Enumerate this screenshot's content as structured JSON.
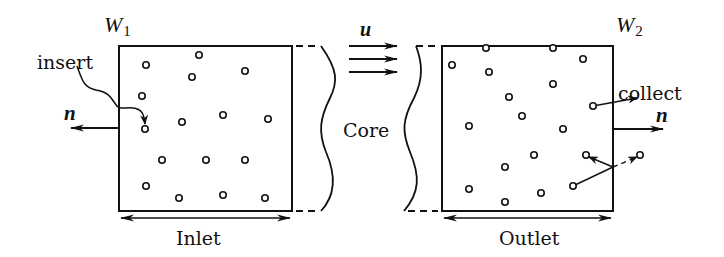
{
  "diagram": {
    "type": "domain-schematic",
    "labels": {
      "w1_main": "W",
      "w1_sub": "1",
      "w2_main": "W",
      "w2_sub": "2",
      "insert": "insert",
      "collect": "collect",
      "normal_left": "n",
      "normal_right": "n",
      "velocity": "u",
      "core": "Core",
      "inlet": "Inlet",
      "outlet": "Outlet"
    },
    "inlet_box": {
      "x": 119,
      "y": 46,
      "w": 173,
      "h": 165
    },
    "outlet_box": {
      "x": 442,
      "y": 46,
      "w": 171,
      "h": 165
    },
    "inlet_particles": [
      [
        146,
        65
      ],
      [
        199,
        55
      ],
      [
        192,
        77
      ],
      [
        245,
        71
      ],
      [
        142,
        96
      ],
      [
        145,
        129
      ],
      [
        182,
        122
      ],
      [
        223,
        115
      ],
      [
        268,
        119
      ],
      [
        162,
        160
      ],
      [
        206,
        160
      ],
      [
        245,
        160
      ],
      [
        146,
        186
      ],
      [
        179,
        198
      ],
      [
        223,
        195
      ],
      [
        265,
        198
      ]
    ],
    "outlet_particles": [
      [
        452,
        65
      ],
      [
        486,
        48
      ],
      [
        553,
        48
      ],
      [
        583,
        59
      ],
      [
        489,
        72
      ],
      [
        553,
        84
      ],
      [
        509,
        97
      ],
      [
        522,
        116
      ],
      [
        469,
        126
      ],
      [
        593,
        106
      ],
      [
        563,
        129
      ],
      [
        534,
        155
      ],
      [
        586,
        155
      ],
      [
        505,
        167
      ],
      [
        469,
        189
      ],
      [
        541,
        193
      ],
      [
        505,
        202
      ],
      [
        573,
        186
      ],
      [
        640,
        155
      ]
    ],
    "colors": {
      "stroke": "#111111",
      "background": "#ffffff"
    }
  }
}
